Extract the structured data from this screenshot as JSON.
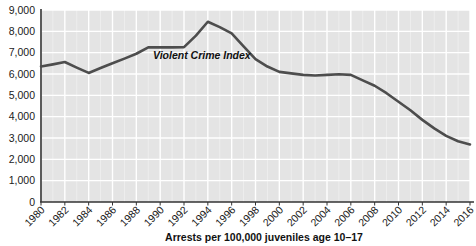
{
  "chart_data": {
    "type": "line",
    "title": "",
    "subtitle": "",
    "xlabel": "Arrests per 100,000 juveniles age 10–17",
    "ylabel": "",
    "xlim": [
      1980,
      2016
    ],
    "ylim": [
      0,
      9000
    ],
    "grid": true,
    "legend_position": "inline-annotation",
    "y_ticks": [
      0,
      1000,
      2000,
      3000,
      4000,
      5000,
      6000,
      7000,
      8000,
      9000
    ],
    "y_tick_labels": [
      "0",
      "1,000",
      "2,000",
      "3,000",
      "4,000",
      "5,000",
      "6,000",
      "7,000",
      "8,000",
      "9,000"
    ],
    "x_ticks": [
      1980,
      1982,
      1984,
      1986,
      1988,
      1990,
      1992,
      1994,
      1996,
      1998,
      2000,
      2002,
      2004,
      2006,
      2008,
      2010,
      2012,
      2014,
      2016
    ],
    "x_tick_labels": [
      "1980",
      "1982",
      "1984",
      "1986",
      "1988",
      "1990",
      "1992",
      "1994",
      "1996",
      "1998",
      "2000",
      "2002",
      "2004",
      "2006",
      "2008",
      "2010",
      "2012",
      "2014",
      "2016"
    ],
    "annotations": [
      {
        "text": "Violent Crime Index",
        "x": 1989.4,
        "y": 6680
      }
    ],
    "series": [
      {
        "name": "Violent Crime Index",
        "color": "#4d4d4d",
        "x": [
          1980,
          1981,
          1982,
          1983,
          1984,
          1985,
          1986,
          1987,
          1988,
          1989,
          1990,
          1991,
          1992,
          1993,
          1994,
          1995,
          1996,
          1997,
          1998,
          1999,
          2000,
          2001,
          2002,
          2003,
          2004,
          2005,
          2006,
          2007,
          2008,
          2009,
          2010,
          2011,
          2012,
          2013,
          2014,
          2015,
          2016
        ],
        "values": [
          6350,
          6450,
          6560,
          6300,
          6050,
          6280,
          6500,
          6720,
          6950,
          7250,
          7250,
          7250,
          7260,
          7800,
          8450,
          8200,
          7900,
          7300,
          6700,
          6350,
          6100,
          6030,
          5960,
          5930,
          5960,
          5990,
          5960,
          5700,
          5450,
          5100,
          4700,
          4300,
          3850,
          3450,
          3100,
          2850,
          2700
        ]
      }
    ]
  },
  "chart_colors": {
    "plot_background": "#e4e4e4",
    "gridline": "#ffffff",
    "axis_line": "#333333",
    "line_color": "#4d4d4d",
    "text_color": "#1a1a1a",
    "page_background": "#ffffff"
  },
  "layout": {
    "plot_left": 41,
    "plot_right": 470,
    "plot_top": 10,
    "plot_bottom": 202,
    "x_caption_x": 264,
    "x_caption_y": 241
  }
}
